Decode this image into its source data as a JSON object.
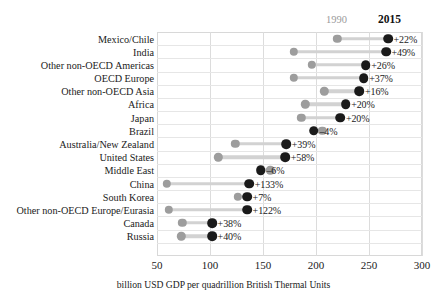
{
  "chart_data": {
    "type": "dumbbell",
    "title": "",
    "xlabel": "billion USD GDP per quadrillion British Thermal Units",
    "ylabel": "",
    "xlim": [
      50,
      300
    ],
    "xticks": [
      50,
      100,
      150,
      200,
      250,
      300
    ],
    "grid": true,
    "legend_position": "top-right",
    "series": [
      {
        "name": "1990",
        "color": "#9d9d9d"
      },
      {
        "name": "2015",
        "color": "#1a1a1a"
      }
    ],
    "categories": [
      "Mexico/Chile",
      "India",
      "Other non-OECD Americas",
      "OECD Europe",
      "Other non-OECD Asia",
      "Africa",
      "Japan",
      "Brazil",
      "Australia/New Zealand",
      "United States",
      "Middle East",
      "China",
      "South Korea",
      "Other non-OECD Europe/Eurasia",
      "Canada",
      "Russia"
    ],
    "rows": [
      {
        "label": "Mexico/Chile",
        "v1990": 220,
        "v2015": 268,
        "change": "+22%"
      },
      {
        "label": "India",
        "v1990": 179,
        "v2015": 266,
        "change": "+49%"
      },
      {
        "label": "Other non-OECD Americas",
        "v1990": 196,
        "v2015": 247,
        "change": "+26%"
      },
      {
        "label": "OECD Europe",
        "v1990": 179,
        "v2015": 245,
        "change": "+37%"
      },
      {
        "label": "Other non-OECD Asia",
        "v1990": 208,
        "v2015": 241,
        "change": "+16%"
      },
      {
        "label": "Africa",
        "v1990": 190,
        "v2015": 228,
        "change": "+20%"
      },
      {
        "label": "Japan",
        "v1990": 186,
        "v2015": 223,
        "change": "+20%"
      },
      {
        "label": "Brazil",
        "v1990": 206,
        "v2015": 198,
        "change": "–4%"
      },
      {
        "label": "Australia/New Zealand",
        "v1990": 124,
        "v2015": 172,
        "change": "+39%"
      },
      {
        "label": "United States",
        "v1990": 108,
        "v2015": 171,
        "change": "+58%"
      },
      {
        "label": "Middle East",
        "v1990": 157,
        "v2015": 148,
        "change": "–6%"
      },
      {
        "label": "China",
        "v1990": 59,
        "v2015": 137,
        "change": "+133%"
      },
      {
        "label": "South Korea",
        "v1990": 126,
        "v2015": 135,
        "change": "+7%"
      },
      {
        "label": "Other non-OECD Europe/Eurasia",
        "v1990": 61,
        "v2015": 135,
        "change": "+122%"
      },
      {
        "label": "Canada",
        "v1990": 74,
        "v2015": 102,
        "change": "+38%"
      },
      {
        "label": "Russia",
        "v1990": 73,
        "v2015": 102,
        "change": "+40%"
      }
    ]
  },
  "legend": {
    "year_old": "1990",
    "year_new": "2015"
  },
  "axis": {
    "tick_labels": [
      "50",
      "100",
      "150",
      "200",
      "250",
      "300"
    ],
    "caption": "billion USD GDP per quadrillion British Thermal Units"
  },
  "colors": {
    "dot_1990": "#9d9d9d",
    "dot_2015": "#1a1a1a",
    "connector": "#d2d2d2",
    "gridline": "#dcdcdc",
    "background": "#ffffff"
  }
}
